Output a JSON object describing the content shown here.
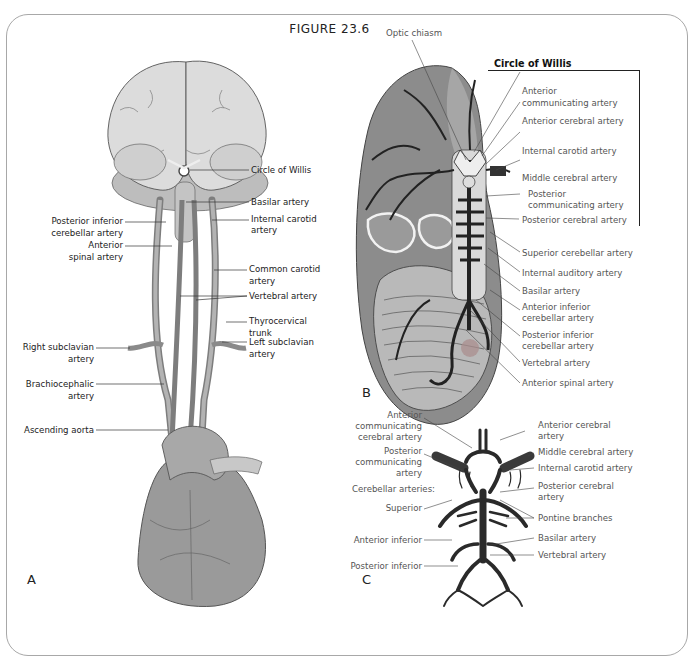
{
  "figure": {
    "title": "FIGURE   23.6"
  },
  "panelA": {
    "letter": "A",
    "labels": {
      "circle_of_willis": "Circle of Willis",
      "basilar": "Basilar artery",
      "internal_carotid_1": "Internal carotid",
      "internal_carotid_2": "artery",
      "pica_1": "Posterior inferior",
      "pica_2": "cerebellar artery",
      "ant_spinal_1": "Anterior",
      "ant_spinal_2": "spinal artery",
      "common_carotid_1": "Common carotid",
      "common_carotid_2": "artery",
      "vertebral": "Vertebral artery",
      "right_subclavian_1": "Right subclavian",
      "right_subclavian_2": "artery",
      "thyrocervical_1": "Thyrocervical",
      "thyrocervical_2": "trunk",
      "left_subclavian_1": "Left subclavian",
      "left_subclavian_2": "artery",
      "brachiocephalic_1": "Brachiocephalic",
      "brachiocephalic_2": "artery",
      "ascending_aorta": "Ascending aorta"
    }
  },
  "panelB": {
    "letter": "B",
    "box_title": "Circle of Willis",
    "labels": {
      "optic_chiasm": "Optic chiasm",
      "acomm_1": "Anterior",
      "acomm_2": "communicating artery",
      "aca": "Anterior cerebral artery",
      "ica": "Internal carotid artery",
      "mca": "Middle cerebral artery",
      "pcomm_1": "Posterior",
      "pcomm_2": "communicating artery",
      "pca": "Posterior cerebral artery",
      "sca": "Superior cerebellar artery",
      "iaa": "Internal auditory artery",
      "basilar": "Basilar artery",
      "aica_1": "Anterior inferior",
      "aica_2": "cerebellar artery",
      "pica_1": "Posterior inferior",
      "pica_2": "cerebellar artery",
      "vertebral": "Vertebral artery",
      "ant_spinal": "Anterior spinal artery"
    }
  },
  "panelC": {
    "letter": "C",
    "labels": {
      "acomm_1": "Anterior",
      "acomm_2": "communicating",
      "acomm_3": "cerebral artery",
      "pcomm_1": "Posterior",
      "pcomm_2": "communicating",
      "pcomm_3": "artery",
      "cerebellar": "Cerebellar arteries:",
      "superior": "Superior",
      "ant_inferior": "Anterior inferior",
      "post_inferior": "Posterior inferior",
      "aca_1": "Anterior cerebral",
      "aca_2": "artery",
      "mca": "Middle cerebral artery",
      "ica": "Internal carotid artery",
      "pca_1": "Posterior cerebral",
      "pca_2": "artery",
      "pontine": "Pontine branches",
      "basilar": "Basilar artery",
      "vertebral": "Vertebral artery"
    }
  },
  "colors": {
    "frame": "#a8a8a8",
    "brain_light": "#d9d9d9",
    "brain_dark": "#8c8c8c",
    "vessel": "#2a2a2a",
    "heart": "#9a9a9a"
  }
}
